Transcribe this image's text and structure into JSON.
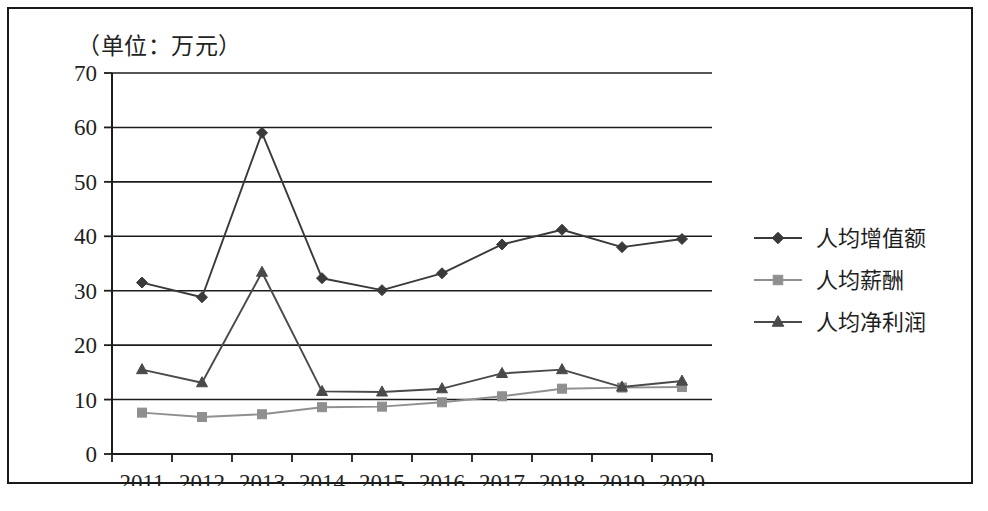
{
  "chart_data": {
    "type": "line",
    "title": "（单位：万元）",
    "xlabel": "",
    "ylabel": "",
    "ylim": [
      0,
      70
    ],
    "ytick_step": 10,
    "yticks": [
      "0",
      "10",
      "20",
      "30",
      "40",
      "50",
      "60",
      "70"
    ],
    "grid": true,
    "grid_axis": "y",
    "legend_position": "right",
    "categories": [
      "2011",
      "2012",
      "2013",
      "2014",
      "2015",
      "2016",
      "2017",
      "2018",
      "2019",
      "2020"
    ],
    "series": [
      {
        "name": "人均增值额",
        "marker": "diamond",
        "color": "#3a3a3a",
        "values": [
          31.5,
          28.8,
          59.0,
          32.3,
          30.1,
          33.2,
          38.5,
          41.2,
          38.0,
          39.5
        ]
      },
      {
        "name": "人均薪酬",
        "marker": "square",
        "color": "#8f8f8f",
        "values": [
          7.6,
          6.8,
          7.3,
          8.6,
          8.7,
          9.5,
          10.6,
          12.0,
          12.2,
          12.3
        ]
      },
      {
        "name": "人均净利润",
        "marker": "triangle",
        "color": "#4a4a4a",
        "values": [
          15.5,
          13.1,
          33.4,
          11.5,
          11.4,
          12.0,
          14.8,
          15.5,
          12.3,
          13.4
        ]
      }
    ]
  },
  "chart": {
    "unit_title": "（单位：万元）",
    "frame_color": "#1a1a1a",
    "background": "#ffffff"
  },
  "legend": {
    "items": [
      {
        "label": "人均增值额",
        "marker": "diamond-marker-icon",
        "color": "#3a3a3a"
      },
      {
        "label": "人均薪酬",
        "marker": "square-marker-icon",
        "color": "#8f8f8f"
      },
      {
        "label": "人均净利润",
        "marker": "triangle-marker-icon",
        "color": "#4a4a4a"
      }
    ]
  }
}
